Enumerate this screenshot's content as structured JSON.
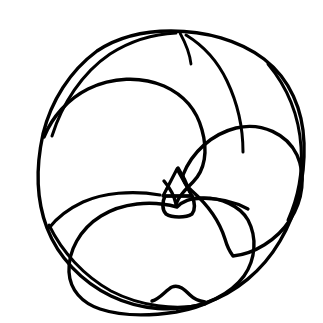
{
  "figure": {
    "domain": "Natural-Image",
    "title": "",
    "caption": "",
    "view": "spiral / umbilical view",
    "background_color": "#ffffff",
    "ink_color": "#000000",
    "canvas": {
      "width": 323,
      "height": 323
    },
    "stroke": {
      "outline_width": 3.4,
      "suture_width": 3.2,
      "aperture_width": 3.6
    }
  },
  "geometry": {
    "test_outline": {
      "name": "outer-test-outline",
      "description": "slightly irregular near-circular periphery of the shell",
      "center": {
        "x": 171,
        "y": 169
      },
      "radius_x": 133,
      "radius_y": 139,
      "bounds": {
        "left": 38,
        "top": 30,
        "right": 305,
        "bottom": 308
      },
      "path": "M 171 31 C 205 31 239 40 264 59 C 290 79 303 110 304 143 C 305 177 297 212 280 241 C 263 270 236 293 205 303 C 175 313 140 310 111 296 C 82 282 58 257 47 228 C 36 199 36 166 43 134 C 51 101 70 71 97 51 C 118 37 145 31 171 31 Z"
    },
    "inner_rim": {
      "name": "inner-peripheral-rim",
      "description": "second line just inside periphery forming a thin crescent at upper-left, upper-right and lower-left",
      "segments": [
        "M 52 136 C 62 104 82 73 110 54 C 132 40 155 34 176 33",
        "M 268 64 C 288 88 299 116 301 147 C 303 175 297 200 288 220",
        "M 49 225 C 62 252 84 276 111 291 C 140 306 176 311 205 304"
      ]
    },
    "chambers": [
      {
        "name": "chamber-left-large",
        "order": 1,
        "description": "largest chamber occupying the left half; arc runs from the upper-left periphery over the top-center, curving right and down to the umbilicus",
        "path": "M 44 137 C 52 117 68 99 88 89 C 112 77 141 76 164 86 C 184 95 197 111 202 130 C 208 151 205 170 193 182 C 185 190 178 197 176 205"
      },
      {
        "name": "chamber-upper-right",
        "order": 2,
        "description": "chamber at top-right between the dorsal suture and the periphery",
        "path": "M 186 35 C 204 46 218 62 227 81 C 238 104 243 129 243 152"
      },
      {
        "name": "chamber-right",
        "order": 3,
        "description": "right lateral chamber, heart-shaped lobe whose inner wall curves into the umbilicus",
        "path": "M 183 175 C 192 152 212 134 236 128 C 262 122 287 134 297 155 C 306 175 303 200 290 220 C 277 240 254 254 233 256 C 230 252 227 246 225 239 C 220 223 208 205 192 191 C 186 186 183 181 183 175 Z"
      },
      {
        "name": "chamber-final-lower",
        "order": 4,
        "description": "large final chamber spanning the lower half, with a small notch along its ventral margin",
        "path": "M 177 207 C 151 200 122 203 101 216 C 80 229 68 251 69 272 C 70 290 82 303 100 309 C 121 316 150 316 176 312 C 204 307 231 294 244 276 C 256 259 257 237 248 220 C 240 206 221 197 200 198 C 191 198 183 201 177 207 Z"
      }
    ],
    "sutures": [
      {
        "name": "suture-dorsal-top",
        "description": "short suture branching from top periphery down to the upper-right chamber",
        "path": "M 180 33 C 186 44 190 55 191 64"
      },
      {
        "name": "suture-umbilical-left",
        "description": "long ventral suture running left from the umbilicus to the lower-left periphery",
        "path": "M 160 195 C 132 190 103 193 83 202 C 68 209 56 219 49 228"
      },
      {
        "name": "suture-umbilical-right",
        "description": "ventral suture running right from the umbilicus toward the right periphery",
        "path": "M 192 199 C 212 197 232 200 248 209"
      }
    ],
    "umbilicus": {
      "name": "umbilical-aperture",
      "description": "central triangular suture junction above a small rounded-square aperture",
      "triangle_path": "M 177 169 L 192 196 L 163 196 Z",
      "aperture_path": "M 165 196 L 192 196 C 195 203 195 210 192 214 C 186 218 172 218 166 214 C 162 210 162 202 165 196 Z",
      "converging_walls": [
        "M 176 204 C 174 195 170 188 164 181",
        "M 178 168 C 183 176 187 184 190 192"
      ]
    },
    "ventral_notch": {
      "name": "ventral-notch",
      "description": "small raised bump/notch on the lower margin of the final chamber",
      "path": "M 152 301 C 160 299 166 290 172 287 C 179 284 185 290 190 295 C 194 299 199 301 205 302"
    }
  },
  "annotations": {
    "labels": [],
    "scale_bar": null,
    "text_present": false
  }
}
